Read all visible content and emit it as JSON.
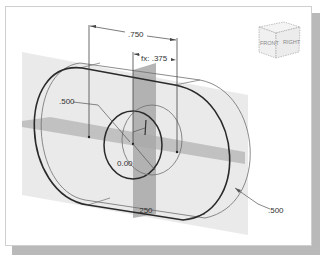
{
  "figure": {
    "view_cube": {
      "faces": [
        "FRONT",
        "RIGHT"
      ]
    },
    "dimensions": {
      "top_length": ".750",
      "half_length": "fx: .375",
      "left_radius": ".500",
      "right_radius": ".500",
      "bottom_thickness": ".250",
      "center_value": "0.00"
    },
    "colors": {
      "bold_line": "#2a2a2a",
      "thin_line": "#6e6e6e",
      "plane_fill": "#d9d9d9",
      "dark_plane": "#9a9a9a",
      "shadow": "#b9b9b9"
    }
  }
}
